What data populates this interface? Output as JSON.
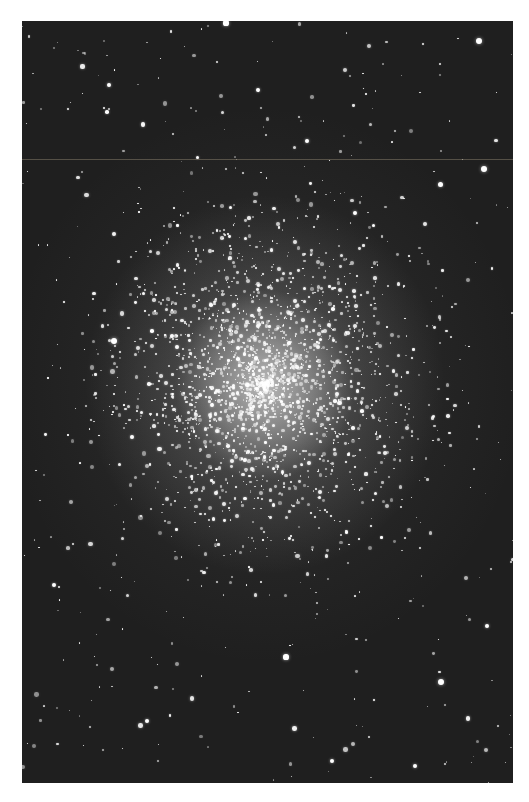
{
  "image": {
    "subject": "globular star cluster photograph (black and white)",
    "background_color": "#ffffff",
    "sky_color": "#1f1f1f",
    "frame": {
      "left": 22,
      "top": 21,
      "width": 491,
      "height": 762
    },
    "cluster_center": {
      "x": 243,
      "y": 364
    },
    "field_star_count": 420,
    "cluster_star_count": 2200,
    "cluster_radius": 230,
    "seed": 7,
    "bright_stars": [
      {
        "x": 204,
        "y": 2,
        "r": 2.6
      },
      {
        "x": 457,
        "y": 20,
        "r": 3
      },
      {
        "x": 87,
        "y": 64,
        "r": 2.4
      },
      {
        "x": 236,
        "y": 69,
        "r": 2.2
      },
      {
        "x": 285,
        "y": 120,
        "r": 2.4
      },
      {
        "x": 462,
        "y": 148,
        "r": 3
      },
      {
        "x": 333,
        "y": 192,
        "r": 2.4
      },
      {
        "x": 92,
        "y": 320,
        "r": 3
      },
      {
        "x": 418,
        "y": 163,
        "r": 2.5
      },
      {
        "x": 264,
        "y": 636,
        "r": 2.6
      },
      {
        "x": 419,
        "y": 661,
        "r": 3
      },
      {
        "x": 310,
        "y": 740,
        "r": 2.4
      },
      {
        "x": 393,
        "y": 745,
        "r": 2.4
      },
      {
        "x": 125,
        "y": 700,
        "r": 2.3
      },
      {
        "x": 465,
        "y": 605,
        "r": 2.4
      }
    ]
  }
}
